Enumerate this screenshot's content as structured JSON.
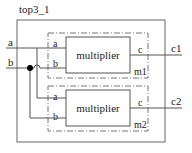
{
  "diagram": {
    "top_module": {
      "name": "top3_1"
    },
    "inputs": [
      {
        "name": "a"
      },
      {
        "name": "b"
      }
    ],
    "outputs": [
      {
        "name": "c1"
      },
      {
        "name": "c2"
      }
    ],
    "instances": [
      {
        "instance_name": "m1",
        "module": "multiplier",
        "ports": {
          "in1": "a",
          "in2": "b",
          "out": "c"
        }
      },
      {
        "instance_name": "m2",
        "module": "multiplier",
        "ports": {
          "in1": "a",
          "in2": "b",
          "out": "c"
        }
      }
    ],
    "connections": [
      {
        "from": "a",
        "to": "m1.a"
      },
      {
        "from": "b",
        "to": "m1.b"
      },
      {
        "from": "a",
        "to": "m2.a"
      },
      {
        "from": "b",
        "to": "m2.b"
      },
      {
        "from": "m1.c",
        "to": "c1"
      },
      {
        "from": "m2.c",
        "to": "c2"
      }
    ],
    "colors": {
      "line": "#555555",
      "text": "#222222",
      "junction": "#000000"
    }
  }
}
